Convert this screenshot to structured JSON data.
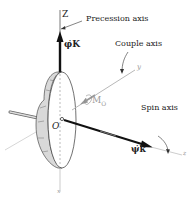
{
  "diagram": {
    "labels": {
      "z_axis": "Z",
      "precession_axis": "Precession axis",
      "precession_rate": "φ̇K",
      "couple_axis": "Couple axis",
      "y_axis": "y",
      "moment": "M",
      "moment_sub": "O",
      "origin": "O",
      "spin_axis": "Spin axis",
      "spin_rate": "ψ̇k",
      "z_axis_small": "z",
      "x_axis": "x"
    },
    "colors": {
      "line_dark": "#111111",
      "line_light": "#b0b0b0",
      "disk_rim": "#d8d8d8",
      "disk_face": "#ffffff",
      "text": "#222222"
    }
  }
}
